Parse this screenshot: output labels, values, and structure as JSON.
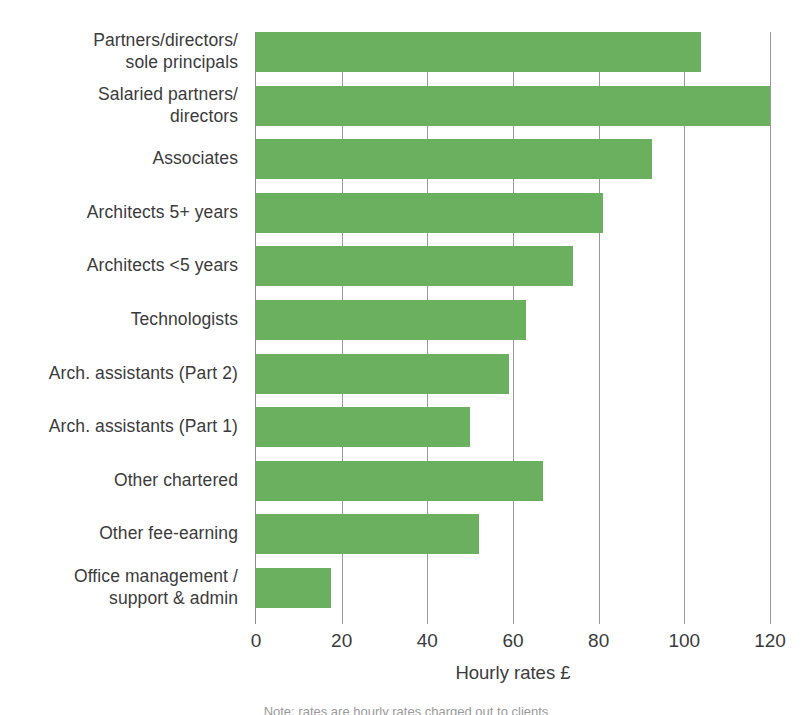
{
  "chart_data": {
    "type": "bar",
    "orientation": "horizontal",
    "title": "",
    "xlabel": "Hourly rates £",
    "ylabel": "",
    "xlim": [
      0,
      120
    ],
    "xticks": [
      0,
      20,
      40,
      60,
      80,
      100,
      120
    ],
    "xtick_labels": [
      "0",
      "20",
      "40",
      "60",
      "80",
      "100",
      "120"
    ],
    "grid": "vertical",
    "legend": "none",
    "bar_color": "#6ab05f",
    "categories": [
      "Partners/directors/\nsole principals",
      "Salaried partners/\ndirectors",
      "Associates",
      "Architects 5+ years",
      "Architects <5 years",
      "Technologists",
      "Arch. assistants (Part 2)",
      "Arch. assistants (Part 1)",
      "Other chartered",
      "Other fee-earning",
      "Office management /\nsupport & admin"
    ],
    "values": [
      104,
      120,
      92.5,
      81,
      74,
      63,
      59,
      50,
      67,
      52,
      17.5
    ]
  },
  "axis": {
    "x_title": "Hourly rates £"
  },
  "caption": {
    "clipped_line": "Note: rates are hourly rates charged out to clients"
  }
}
